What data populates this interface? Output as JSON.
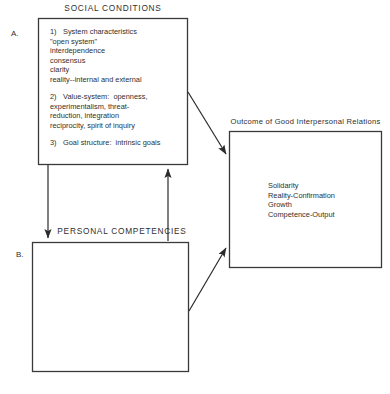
{
  "figure": {
    "social_conditions_title": "SOCIAL CONDITIONS",
    "personal_competencies_title": "PERSONAL COMPETENCIES",
    "outcome_caption": "Outcome of Good Interpersonal Relations",
    "label_a": "A.",
    "label_b": "B.",
    "stroke_color": "#3a3a3a",
    "text_color": "#2f2f2f"
  },
  "box_a": {
    "items": [
      {
        "marker": "1)",
        "lines": "System characteristics\n\"open system\"\ninterdependence\nconsensus\nclarity\nreality--internal and external"
      },
      {
        "marker": "2)",
        "lines": "Value-system:  openness,\nexperimentalism, threat-\nreduction, integration\nreciprocity, spirit of inquiry"
      },
      {
        "marker": "3)",
        "lines": "Goal structure:  intrinsic goals"
      }
    ]
  },
  "box_b": {
    "content": ""
  },
  "box_outcome": {
    "lines": "Solidarity\nReality-Confirmation\nGrowth\nCompetence-Output"
  }
}
